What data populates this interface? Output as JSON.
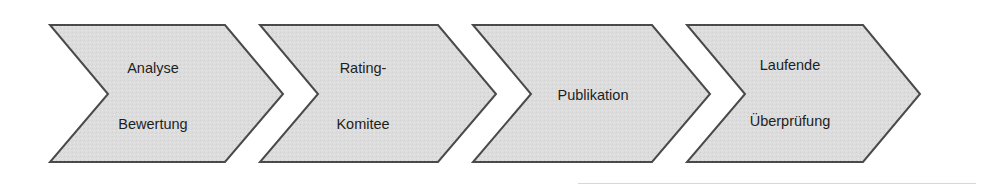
{
  "diagram": {
    "type": "chevron-process",
    "fill_color": "#dcdcdc",
    "stroke_color": "#4a4a4a",
    "steps": [
      {
        "id": 1,
        "lines": [
          "Analyse",
          "Bewertung"
        ],
        "points": "50,25 225,25 283,94 225,162 50,162 108,94",
        "line_positions": [
          [
            153,
            60
          ],
          [
            153,
            116
          ]
        ]
      },
      {
        "id": 2,
        "lines": [
          "Rating-",
          "Komitee"
        ],
        "points": "260,25 438,25 496,94 438,162 260,162 318,94",
        "line_positions": [
          [
            363,
            60
          ],
          [
            363,
            116
          ]
        ]
      },
      {
        "id": 3,
        "lines": [
          "Publikation"
        ],
        "points": "473,25 652,25 710,94 652,162 473,162 531,94",
        "line_positions": [
          [
            593,
            87
          ]
        ]
      },
      {
        "id": 4,
        "lines": [
          "Laufende",
          "Überprüfung"
        ],
        "points": "687,25 863,25 920,94 863,162 687,162 745,94",
        "line_positions": [
          [
            790,
            57
          ],
          [
            790,
            113
          ]
        ]
      }
    ]
  }
}
